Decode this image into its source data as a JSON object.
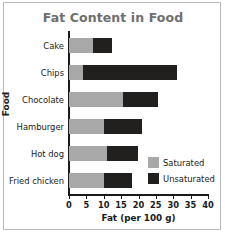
{
  "chart_data": {
    "type": "bar",
    "orientation": "horizontal",
    "stacked": true,
    "title": "Fat Content in Food",
    "xlabel": "Fat (per 100 g)",
    "ylabel": "Food",
    "categories": [
      "Cake",
      "Chips",
      "Chocolate",
      "Hamburger",
      "Hot dog",
      "Fried chicken"
    ],
    "series": [
      {
        "name": "Saturated",
        "color": "#a8a8a8",
        "values": [
          7,
          4,
          15.5,
          10,
          11,
          10
        ]
      },
      {
        "name": "Unsaturated",
        "color": "#221f1f",
        "values": [
          5.5,
          27,
          10,
          11,
          9,
          8
        ]
      }
    ],
    "totals": [
      12.5,
      31,
      25.5,
      21,
      20,
      18
    ],
    "xlim": [
      0,
      40
    ],
    "xticks": [
      0,
      5,
      10,
      15,
      20,
      25,
      30,
      35,
      40
    ],
    "xtick_labels": [
      "0",
      "5",
      "10",
      "15",
      "20",
      "25",
      "30",
      "35",
      "40"
    ],
    "grid": false,
    "legend_position": "inside-bottom-right",
    "title_color": "#6e6e6e",
    "axis_color": "#1a1a1a",
    "border_color": "#b9b9b9",
    "background": "#ffffff"
  }
}
